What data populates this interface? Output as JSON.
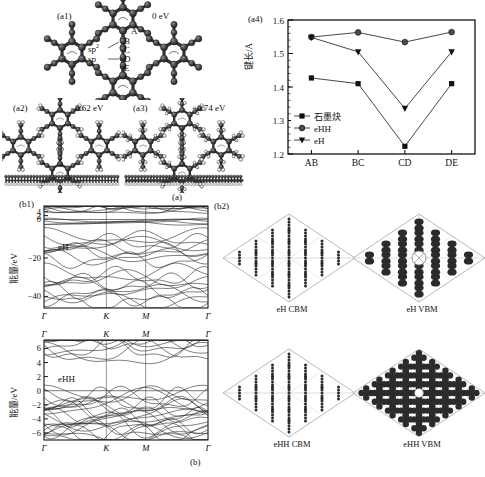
{
  "figure": {
    "subcaption_a": "(a)",
    "subcaption_b": "(b)"
  },
  "panel_a1": {
    "tag": "(a1)",
    "energy": "0 eV",
    "site_labels": [
      "A",
      "B",
      "C",
      "D",
      "E"
    ],
    "hybrid_sp2": "sp",
    "hybrid_sp2_sup": "2",
    "hybrid_sp": "sp"
  },
  "panel_a2": {
    "tag": "(a2)",
    "energy": "−0.62 eV"
  },
  "panel_a3": {
    "tag": "(a3)",
    "energy": "−0.74 eV"
  },
  "panel_b1": {
    "tag": "(b1)",
    "top_series_label": "eH",
    "bottom_series_label": "eHH"
  },
  "panel_b2": {
    "tag": "(b2)",
    "captions": [
      "eH CBM",
      "eH VBM",
      "eHH CBM",
      "eHH VBM"
    ]
  },
  "chart_data": {
    "type": "line",
    "tag": "(a4)",
    "title": "",
    "xlabel": "",
    "ylabel": "键长/Å",
    "categories": [
      "AB",
      "BC",
      "CD",
      "DE"
    ],
    "xticklabels": [
      "AB",
      "BC",
      "CD",
      "DE"
    ],
    "yticklabels": [
      "1.2",
      "1.3",
      "1.4",
      "1.5",
      "1.6"
    ],
    "ylim": [
      1.2,
      1.6
    ],
    "ytick_values": [
      1.2,
      1.3,
      1.4,
      1.5,
      1.6
    ],
    "grid": false,
    "legend_position": "lower-left",
    "series": [
      {
        "name": "石墨炔",
        "marker": "square",
        "values": [
          1.427,
          1.41,
          1.223,
          1.41
        ]
      },
      {
        "name": "eHH",
        "marker": "circle",
        "values": [
          1.549,
          1.563,
          1.534,
          1.564
        ]
      },
      {
        "name": "eH",
        "marker": "triangle-down",
        "values": [
          1.548,
          1.505,
          1.336,
          1.505
        ]
      }
    ]
  },
  "band_top": {
    "series_label": "eH",
    "ylabel": "能量/eV",
    "yticklabels": [
      "4",
      "2",
      "0",
      "−20",
      "−40"
    ],
    "ytick_values": [
      4,
      2,
      0,
      -20,
      -40
    ],
    "ylim": [
      -46,
      7
    ],
    "xticklabels": [
      "Γ",
      "K",
      "M",
      "Γ"
    ],
    "high_symmetry_points": [
      "Γ",
      "K",
      "M",
      "Γ"
    ]
  },
  "band_bottom": {
    "series_label": "eHH",
    "ylabel": "能量/eV",
    "yticklabels": [
      "6",
      "4",
      "2",
      "0",
      "−2",
      "−4",
      "−6"
    ],
    "ytick_values": [
      6,
      4,
      2,
      0,
      -2,
      -4,
      -6
    ],
    "ylim": [
      -7,
      7.2
    ],
    "xticklabels": [
      "Γ",
      "K",
      "M",
      "Γ"
    ],
    "high_symmetry_points": [
      "Γ",
      "K",
      "M",
      "Γ"
    ]
  },
  "colors": {
    "ink": "#111111",
    "atom_dark": "#3a3a3a",
    "atom_light": "#f2f2f2",
    "lobe": "#2b2b2b",
    "axis": "#000000"
  }
}
